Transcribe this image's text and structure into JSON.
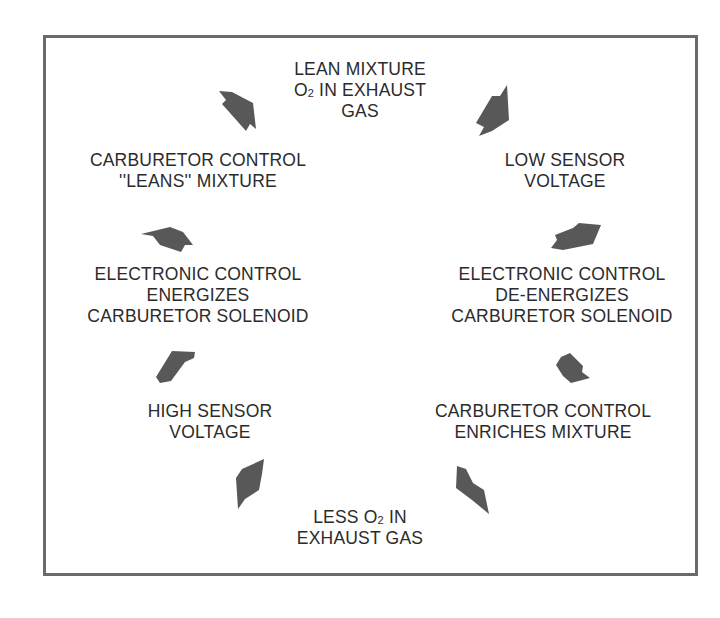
{
  "diagram": {
    "type": "cycle",
    "title": "",
    "colors": {
      "frame": "#6a6a6a",
      "arrow": "#585858",
      "text": "#2b2b2b",
      "background": "#ffffff"
    },
    "nodes": [
      {
        "id": "lean-mixture",
        "lines": [
          "LEAN MIXTURE",
          "O2 IN EXHAUST",
          "GAS"
        ]
      },
      {
        "id": "low-sensor-voltage",
        "lines": [
          "LOW SENSOR",
          "VOLTAGE"
        ]
      },
      {
        "id": "electronic-control-de-energizes",
        "lines": [
          "ELECTRONIC CONTROL",
          "DE-ENERGIZES",
          "CARBURETOR SOLENOID"
        ]
      },
      {
        "id": "carburetor-control-enriches",
        "lines": [
          "CARBURETOR CONTROL",
          "ENRICHES MIXTURE"
        ]
      },
      {
        "id": "less-o2",
        "lines": [
          "LESS O2 IN",
          "EXHAUST GAS"
        ]
      },
      {
        "id": "high-sensor-voltage",
        "lines": [
          "HIGH SENSOR",
          "VOLTAGE"
        ]
      },
      {
        "id": "electronic-control-energizes",
        "lines": [
          "ELECTRONIC CONTROL",
          "ENERGIZES",
          "CARBURETOR SOLENOID"
        ]
      },
      {
        "id": "carburetor-control-leans",
        "lines": [
          "CARBURETOR CONTROL",
          "''LEANS'' MIXTURE"
        ]
      }
    ],
    "labels": {
      "lean_l1": "LEAN MIXTURE",
      "lean_l2_a": "O",
      "lean_l2_sub": "2",
      "lean_l2_b": " IN EXHAUST",
      "lean_l3": "GAS",
      "low_l1": "LOW SENSOR",
      "low_l2": "VOLTAGE",
      "deen_l1": "ELECTRONIC CONTROL",
      "deen_l2": "DE-ENERGIZES",
      "deen_l3": "CARBURETOR SOLENOID",
      "enrich_l1": "CARBURETOR CONTROL",
      "enrich_l2": "ENRICHES MIXTURE",
      "less_l1_a": "LESS O",
      "less_l1_sub": "2",
      "less_l1_b": " IN",
      "less_l2": "EXHAUST GAS",
      "high_l1": "HIGH SENSOR",
      "high_l2": "VOLTAGE",
      "en_l1": "ELECTRONIC CONTROL",
      "en_l2": "ENERGIZES",
      "en_l3": "CARBURETOR SOLENOID",
      "leans_l1": "CARBURETOR CONTROL",
      "leans_l2": "''LEANS'' MIXTURE"
    },
    "edges": [
      {
        "from": "lean-mixture",
        "to": "low-sensor-voltage",
        "direction": "clockwise"
      },
      {
        "from": "low-sensor-voltage",
        "to": "electronic-control-de-energizes"
      },
      {
        "from": "electronic-control-de-energizes",
        "to": "carburetor-control-enriches"
      },
      {
        "from": "carburetor-control-enriches",
        "to": "less-o2"
      },
      {
        "from": "less-o2",
        "to": "high-sensor-voltage"
      },
      {
        "from": "high-sensor-voltage",
        "to": "electronic-control-energizes"
      },
      {
        "from": "electronic-control-energizes",
        "to": "carburetor-control-leans"
      },
      {
        "from": "carburetor-control-leans",
        "to": "lean-mixture"
      }
    ]
  }
}
